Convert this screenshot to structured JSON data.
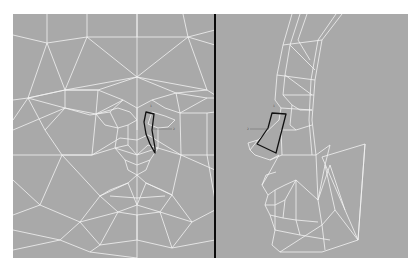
{
  "figure": {
    "panels": [
      {
        "id": "front-view",
        "description": "Frontal wireframe face mesh",
        "background": "#a9a9a9",
        "highlight": {
          "label_a": "1",
          "label_b": "2"
        }
      },
      {
        "id": "side-view",
        "description": "Profile wireframe face mesh",
        "background": "#a9a9a9",
        "highlight": {
          "label_a": "1",
          "label_b": "2"
        }
      }
    ],
    "colors": {
      "panel_bg": "#a9a9a9",
      "mesh_line": "#f2f2f2",
      "highlight_outline": "#111111",
      "divider": "#0a0a0a",
      "page_bg": "#ffffff"
    }
  }
}
